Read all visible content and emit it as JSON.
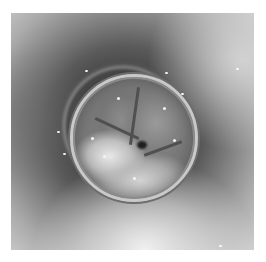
{
  "image": {
    "description": "Grayscale endoscopic photograph looking down a lumen at a circular prosthetic heart valve with three leaflets, surrounded by a sewing ring with sutures; white border around photo",
    "colors": {
      "border": "#ffffff",
      "lumen_dark": "#3a3a3a",
      "periphery_light": "#cfcfcf",
      "valve_ring": "#c9c9c9",
      "commissure_dark": "#1e1e1e"
    },
    "regions": {
      "photo_bounds": [
        11,
        13,
        254,
        250
      ],
      "valve_center": [
        122,
        125
      ],
      "valve_radius": 62
    }
  }
}
